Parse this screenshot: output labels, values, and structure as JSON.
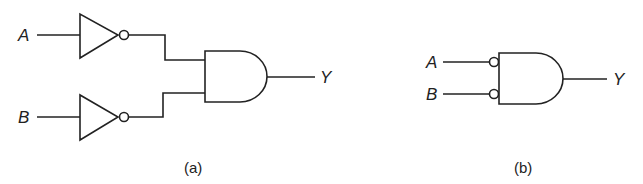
{
  "diagram_a": {
    "caption": "(a)",
    "input_a_label": "A",
    "input_b_label": "B",
    "output_label": "Y",
    "components": [
      "inverter-a",
      "inverter-b",
      "and-gate"
    ]
  },
  "diagram_b": {
    "caption": "(b)",
    "input_a_label": "A",
    "input_b_label": "B",
    "output_label": "Y",
    "components": [
      "and-gate-with-inverted-inputs"
    ]
  },
  "colors": {
    "stroke": "#222222",
    "background": "#ffffff"
  }
}
